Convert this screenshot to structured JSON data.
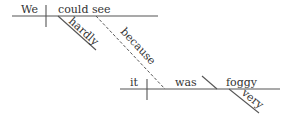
{
  "diagram": {
    "type": "sentence-diagram",
    "main_clause": {
      "subject": "We",
      "verb": "could see",
      "modifiers": [
        "hardly"
      ]
    },
    "connector": "because",
    "sub_clause": {
      "subject": "it",
      "verb": "was",
      "complement": "foggy",
      "modifiers": [
        "very"
      ]
    }
  }
}
